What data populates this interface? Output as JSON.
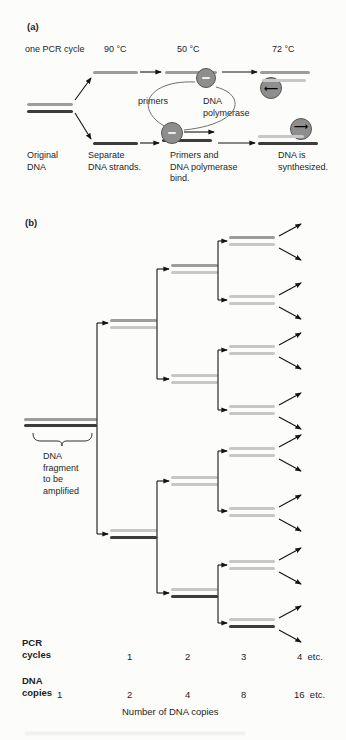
{
  "colors": {
    "light": "#c7c7c7",
    "mid": "#9d9d9d",
    "dark": "#3c3c3c",
    "circle_fill": "#8e8e8e",
    "circle_stroke": "#555555",
    "arrow": "#141414",
    "text": "#1e1e1e"
  },
  "panel_a": {
    "label": "(a)",
    "cycle_label": "one PCR cycle",
    "temps": [
      "90 °C",
      "50 °C",
      "72 °C"
    ],
    "primers_label": "primers",
    "figure": {
      "strands": [
        {
          "x": 27,
          "y": 103,
          "w": 46,
          "s": "mid"
        },
        {
          "x": 27,
          "y": 110,
          "w": 46,
          "s": "dark"
        },
        {
          "x": 93,
          "y": 71,
          "w": 45,
          "s": "mid"
        },
        {
          "x": 93,
          "y": 142,
          "w": 45,
          "s": "dark"
        },
        {
          "x": 165,
          "y": 71,
          "w": 52,
          "s": "mid"
        },
        {
          "x": 162,
          "y": 139,
          "w": 50,
          "s": "dark"
        },
        {
          "x": 260,
          "y": 71,
          "w": 50,
          "s": "mid"
        },
        {
          "x": 262,
          "y": 79,
          "w": 44,
          "s": "light",
          "z": 3
        },
        {
          "x": 258,
          "y": 135,
          "w": 46,
          "s": "light",
          "z": 3
        },
        {
          "x": 258,
          "y": 142,
          "w": 60,
          "s": "dark"
        }
      ],
      "circles": [
        {
          "cx": 206,
          "cy": 78,
          "r": 10,
          "dash": true
        },
        {
          "cx": 172,
          "cy": 133,
          "r": 11,
          "dash": true
        },
        {
          "cx": 271,
          "cy": 88,
          "r": 11,
          "arrow": "left",
          "ay": 5
        },
        {
          "cx": 301,
          "cy": 129,
          "r": 11,
          "arrow": "right",
          "ay": 2
        }
      ],
      "arrows": [
        {
          "x1": 75,
          "y1": 100,
          "x2": 91,
          "y2": 78
        },
        {
          "x1": 75,
          "y1": 113,
          "x2": 91,
          "y2": 139
        },
        {
          "x1": 140,
          "y1": 72,
          "x2": 161,
          "y2": 72
        },
        {
          "x1": 222,
          "y1": 72,
          "x2": 257,
          "y2": 72
        },
        {
          "x1": 140,
          "y1": 143,
          "x2": 159,
          "y2": 143
        },
        {
          "x1": 184,
          "y1": 132,
          "x2": 214,
          "y2": 132
        },
        {
          "x1": 218,
          "y1": 143,
          "x2": 255,
          "y2": 143
        }
      ],
      "curves": [
        {
          "d": "M 164,126 C 134,108 148,80 195,82"
        },
        {
          "d": "M 216,87 C 247,95 243,124 184,130"
        }
      ],
      "texts": [
        {
          "name": "polymerase-label",
          "x": 203,
          "y": 96,
          "w": 64,
          "lines": [
            "DNA",
            "polymerase"
          ]
        },
        {
          "name": "step-original-dna",
          "x": 27,
          "y": 150,
          "lines": [
            "Original",
            "DNA"
          ]
        },
        {
          "name": "step-separate-strands",
          "x": 88,
          "y": 150,
          "lines": [
            "Separate",
            "DNA strands."
          ]
        },
        {
          "name": "step-primers-bind",
          "x": 170,
          "y": 150,
          "lines": [
            "Primers and",
            "DNA polymerase",
            "bind."
          ]
        },
        {
          "name": "step-dna-synthesized",
          "x": 278,
          "y": 150,
          "lines": [
            "DNA is",
            "synthesized."
          ]
        }
      ]
    }
  },
  "panel_b": {
    "label": "(b)",
    "caption": "Number of DNA copies",
    "figure": {
      "strands": [
        {
          "x": 24,
          "y": 418,
          "w": 73,
          "s": "mid"
        },
        {
          "x": 24,
          "y": 424,
          "w": 73,
          "s": "dark"
        },
        {
          "x": 110,
          "y": 319,
          "w": 47,
          "s": "mid"
        },
        {
          "x": 110,
          "y": 326,
          "w": 47,
          "s": "light"
        },
        {
          "x": 110,
          "y": 529,
          "w": 47,
          "s": "light"
        },
        {
          "x": 110,
          "y": 536,
          "w": 47,
          "s": "dark"
        },
        {
          "x": 171,
          "y": 264,
          "w": 47,
          "s": "mid"
        },
        {
          "x": 171,
          "y": 271,
          "w": 47,
          "s": "light"
        },
        {
          "x": 171,
          "y": 374,
          "w": 47,
          "s": "light"
        },
        {
          "x": 171,
          "y": 381,
          "w": 47,
          "s": "light"
        },
        {
          "x": 171,
          "y": 476,
          "w": 47,
          "s": "light"
        },
        {
          "x": 171,
          "y": 483,
          "w": 47,
          "s": "light"
        },
        {
          "x": 171,
          "y": 588,
          "w": 47,
          "s": "light"
        },
        {
          "x": 171,
          "y": 595,
          "w": 47,
          "s": "dark"
        },
        {
          "x": 229,
          "y": 236,
          "w": 46,
          "s": "mid"
        },
        {
          "x": 229,
          "y": 243,
          "w": 46,
          "s": "light"
        },
        {
          "x": 229,
          "y": 295,
          "w": 46,
          "s": "light"
        },
        {
          "x": 229,
          "y": 302,
          "w": 46,
          "s": "light"
        },
        {
          "x": 229,
          "y": 345,
          "w": 46,
          "s": "light"
        },
        {
          "x": 229,
          "y": 352,
          "w": 46,
          "s": "light"
        },
        {
          "x": 229,
          "y": 405,
          "w": 46,
          "s": "light"
        },
        {
          "x": 229,
          "y": 412,
          "w": 46,
          "s": "light"
        },
        {
          "x": 229,
          "y": 447,
          "w": 46,
          "s": "light"
        },
        {
          "x": 229,
          "y": 454,
          "w": 46,
          "s": "light"
        },
        {
          "x": 229,
          "y": 507,
          "w": 46,
          "s": "light"
        },
        {
          "x": 229,
          "y": 514,
          "w": 46,
          "s": "light"
        },
        {
          "x": 229,
          "y": 560,
          "w": 46,
          "s": "light"
        },
        {
          "x": 229,
          "y": 567,
          "w": 46,
          "s": "light"
        },
        {
          "x": 229,
          "y": 618,
          "w": 46,
          "s": "light"
        },
        {
          "x": 229,
          "y": 625,
          "w": 46,
          "s": "dark"
        }
      ],
      "brackets": [
        {
          "vx": 97,
          "y1": 323,
          "y2": 534,
          "ax": 108
        },
        {
          "vx": 157,
          "y1": 269,
          "y2": 379,
          "ax": 169
        },
        {
          "vx": 157,
          "y1": 481,
          "y2": 593,
          "ax": 169
        },
        {
          "vx": 218,
          "y1": 241,
          "y2": 300,
          "ax": 227
        },
        {
          "vx": 218,
          "y1": 350,
          "y2": 410,
          "ax": 227
        },
        {
          "vx": 218,
          "y1": 451,
          "y2": 511,
          "ax": 227
        },
        {
          "vx": 218,
          "y1": 565,
          "y2": 623,
          "ax": 227
        }
      ],
      "arrows": [
        {
          "x1": 279,
          "y1": 236,
          "x2": 301,
          "y2": 224
        },
        {
          "x1": 279,
          "y1": 248,
          "x2": 301,
          "y2": 260
        },
        {
          "x1": 279,
          "y1": 295,
          "x2": 301,
          "y2": 283
        },
        {
          "x1": 279,
          "y1": 307,
          "x2": 301,
          "y2": 319
        },
        {
          "x1": 279,
          "y1": 345,
          "x2": 301,
          "y2": 333
        },
        {
          "x1": 279,
          "y1": 357,
          "x2": 301,
          "y2": 369
        },
        {
          "x1": 279,
          "y1": 405,
          "x2": 301,
          "y2": 393
        },
        {
          "x1": 279,
          "y1": 417,
          "x2": 301,
          "y2": 429
        },
        {
          "x1": 279,
          "y1": 447,
          "x2": 301,
          "y2": 435
        },
        {
          "x1": 279,
          "y1": 459,
          "x2": 301,
          "y2": 471
        },
        {
          "x1": 279,
          "y1": 507,
          "x2": 301,
          "y2": 495
        },
        {
          "x1": 279,
          "y1": 519,
          "x2": 301,
          "y2": 531
        },
        {
          "x1": 279,
          "y1": 560,
          "x2": 301,
          "y2": 548
        },
        {
          "x1": 279,
          "y1": 572,
          "x2": 301,
          "y2": 584
        },
        {
          "x1": 279,
          "y1": 618,
          "x2": 301,
          "y2": 606
        },
        {
          "x1": 279,
          "y1": 630,
          "x2": 301,
          "y2": 642
        }
      ],
      "brace": "M33,433 C33,439 36,441 41,441 L57,441 C60,441 62,442 62,446 C62,442 64,441 67,441 L84,441 C89,441 92,439 92,433",
      "texts": [
        {
          "name": "fragment-label",
          "x": 43,
          "y": 451,
          "lines": [
            "DNA",
            "fragment",
            "to be",
            "amplified"
          ]
        },
        {
          "name": "pcr-cycles-label",
          "x": 22,
          "y": 637,
          "bold": true,
          "lines": [
            "PCR",
            "cycles"
          ]
        },
        {
          "name": "dna-copies-label",
          "x": 22,
          "y": 675,
          "bold": true,
          "lines": [
            "DNA",
            "copies"
          ]
        }
      ],
      "rows": [
        {
          "name": "pcr-cycle-count",
          "y": 651,
          "items": [
            {
              "t": "1",
              "x": 127
            },
            {
              "t": "2",
              "x": 185
            },
            {
              "t": "3",
              "x": 241
            },
            {
              "t": "4  etc.",
              "x": 297
            }
          ]
        },
        {
          "name": "dna-copy-count",
          "y": 689,
          "items": [
            {
              "t": "1",
              "x": 57
            },
            {
              "t": "2",
              "x": 127
            },
            {
              "t": "4",
              "x": 185
            },
            {
              "t": "8",
              "x": 241
            },
            {
              "t": "16  etc.",
              "x": 294
            }
          ]
        }
      ]
    }
  }
}
